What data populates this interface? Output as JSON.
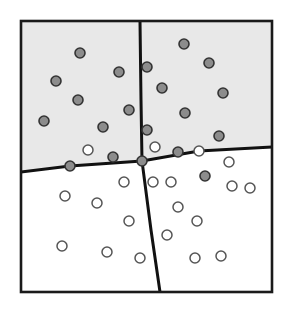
{
  "figure": {
    "type": "scatter",
    "width": 292,
    "height": 309
  },
  "chart_data": {
    "type": "scatter",
    "title": "",
    "xlabel": "",
    "ylabel": "",
    "xlim": [
      21,
      272
    ],
    "ylim": [
      21,
      292
    ],
    "grid": false,
    "legend": "none",
    "colors": {
      "frame_stroke": "#1a1a1a",
      "boundary_stroke": "#111111",
      "shaded_region_fill": "#e8e8e8",
      "plain_region_fill": "#ffffff",
      "filled_point_fill": "#8c8c8c",
      "filled_point_stroke": "#333333",
      "open_point_fill": "#ffffff",
      "open_point_stroke": "#555555"
    },
    "frame": {
      "x": 21,
      "y": 21,
      "width": 251,
      "height": 271,
      "stroke_width": 2.6
    },
    "regions": [
      {
        "name": "upper-left-shaded",
        "shaded": true
      },
      {
        "name": "upper-right-shaded",
        "shaded": true
      },
      {
        "name": "lower-left-plain",
        "shaded": false
      },
      {
        "name": "lower-right-plain",
        "shaded": false
      }
    ],
    "boundaries": [
      {
        "name": "near-horizontal-boundary",
        "points": [
          [
            21,
            172
          ],
          [
            70,
            166
          ],
          [
            142,
            161
          ],
          [
            199,
            151
          ],
          [
            272,
            147
          ]
        ],
        "stroke_width": 3.0
      },
      {
        "name": "near-vertical-boundary",
        "points": [
          [
            140,
            21
          ],
          [
            141,
            100
          ],
          [
            142,
            161
          ],
          [
            151,
            230
          ],
          [
            160,
            292
          ]
        ],
        "stroke_width": 3.0
      }
    ],
    "series": [
      {
        "name": "class-a-filled",
        "marker": "filled-circle",
        "radius": 5.0,
        "points": [
          [
            80,
            53
          ],
          [
            56,
            81
          ],
          [
            119,
            72
          ],
          [
            78,
            100
          ],
          [
            44,
            121
          ],
          [
            103,
            127
          ],
          [
            129,
            110
          ],
          [
            147,
            67
          ],
          [
            162,
            88
          ],
          [
            184,
            44
          ],
          [
            209,
            63
          ],
          [
            223,
            93
          ],
          [
            185,
            113
          ],
          [
            219,
            136
          ],
          [
            147,
            130
          ],
          [
            70,
            166
          ],
          [
            113,
            157
          ],
          [
            142,
            161
          ],
          [
            178,
            152
          ],
          [
            205,
            176
          ]
        ]
      },
      {
        "name": "class-b-open",
        "marker": "open-circle",
        "radius": 5.0,
        "points": [
          [
            88,
            150
          ],
          [
            155,
            147
          ],
          [
            199,
            151
          ],
          [
            124,
            182
          ],
          [
            153,
            182
          ],
          [
            171,
            182
          ],
          [
            65,
            196
          ],
          [
            97,
            203
          ],
          [
            129,
            221
          ],
          [
            178,
            207
          ],
          [
            197,
            221
          ],
          [
            232,
            186
          ],
          [
            229,
            162
          ],
          [
            250,
            188
          ],
          [
            62,
            246
          ],
          [
            107,
            252
          ],
          [
            140,
            258
          ],
          [
            167,
            235
          ],
          [
            195,
            258
          ],
          [
            221,
            256
          ]
        ]
      }
    ]
  }
}
